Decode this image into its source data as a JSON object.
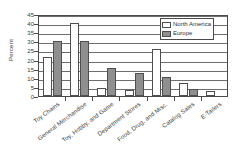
{
  "chart_data": {
    "type": "bar",
    "title": "",
    "xlabel": "",
    "ylabel": "Percent",
    "ylim": [
      0,
      45
    ],
    "yticks": [
      0,
      5,
      10,
      15,
      20,
      25,
      30,
      35,
      40,
      45
    ],
    "grid": true,
    "legend_position": "top-right",
    "categories": [
      "Toy Chains",
      "General Merchandise",
      "Toy, Hobby, and Game",
      "Department Stores",
      "Food, Drug, and Misc.",
      "Catalog Sales",
      "E-Tailers"
    ],
    "series": [
      {
        "name": "North America",
        "color": "#ffffff",
        "values": [
          21.5,
          40,
          4.5,
          3.5,
          26,
          7,
          2.5
        ]
      },
      {
        "name": "Europe",
        "color": "#8f8f8f",
        "values": [
          30,
          30,
          15.5,
          12.5,
          10.5,
          4,
          0
        ]
      }
    ]
  },
  "legend": {
    "items": [
      {
        "label": "North America"
      },
      {
        "label": "Europe"
      }
    ]
  },
  "axis": {
    "y_title": "Percent"
  }
}
